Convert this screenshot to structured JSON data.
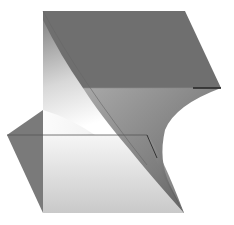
{
  "figure": {
    "title": "3D folded surface (cusp fold)",
    "colors": {
      "background": "#ffffff",
      "top_face": "#6f6f6f",
      "mid_face": "#8a8a8a",
      "wedge": "#7a7a7a",
      "highlight": "#ffffff",
      "edge": "#444444"
    }
  }
}
